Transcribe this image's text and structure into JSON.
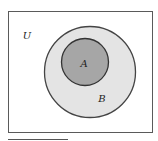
{
  "diagram": {
    "type": "venn",
    "universe": {
      "label": "U",
      "fill": "#ffffff",
      "stroke": "#555555"
    },
    "sets": [
      {
        "name": "B",
        "label": "B",
        "fill": "#e4e4e4",
        "stroke": "#444444",
        "contains": [
          "A"
        ]
      },
      {
        "name": "A",
        "label": "A",
        "fill": "#a6a6a6",
        "stroke": "#333333",
        "subset_of": "B"
      }
    ],
    "relation": "A ⊂ B ⊂ U"
  }
}
